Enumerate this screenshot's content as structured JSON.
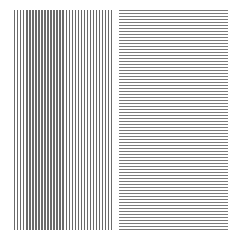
{
  "image": {
    "description": "Two square grating patterns side by side: vertical black lines on the left, horizontal lines on the right",
    "background": "#ffffff",
    "panels": [
      {
        "name": "vertical-grating",
        "orientation": "vertical",
        "line_color": "#6a6a6a",
        "approx_line_count": 33
      },
      {
        "name": "horizontal-grating",
        "orientation": "horizontal",
        "line_color": "#7a7a7a",
        "approx_line_count": 74
      }
    ]
  }
}
